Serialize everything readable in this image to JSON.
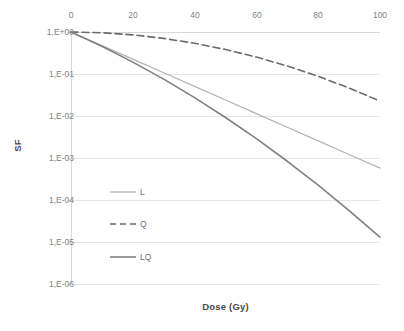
{
  "chart_data": {
    "type": "line",
    "title": "",
    "xlabel": "Dose (Gy)",
    "ylabel": "SF",
    "xlim": [
      0,
      100
    ],
    "ylim": [
      1e-06,
      1
    ],
    "yscale": "log",
    "xaxis_position": "top",
    "grid": "horizontal",
    "legend_position": "inside-left",
    "x_ticks": [
      "0",
      "20",
      "40",
      "60",
      "80",
      "100"
    ],
    "x_tick_values": [
      0,
      20,
      40,
      60,
      80,
      100
    ],
    "y_ticks": [
      "1,E+00",
      "1,E-01",
      "1,E-02",
      "1,E-03",
      "1,E-04",
      "1,E-05",
      "1,E-06"
    ],
    "y_tick_values": [
      1,
      0.1,
      0.01,
      0.001,
      0.0001,
      1e-05,
      1e-06
    ],
    "x": [
      0,
      10,
      20,
      30,
      40,
      50,
      60,
      70,
      80,
      90,
      100
    ],
    "series": [
      {
        "name": "L",
        "style": "solid",
        "color": "#b3b3b3",
        "values": [
          1.0,
          0.474,
          0.225,
          0.107,
          0.0506,
          0.024,
          0.0114,
          0.0054,
          0.00256,
          0.00121,
          0.000575
        ]
      },
      {
        "name": "Q",
        "style": "dashed",
        "color": "#6b6b6b",
        "values": [
          1.0,
          0.961,
          0.855,
          0.704,
          0.539,
          0.383,
          0.253,
          0.155,
          0.088,
          0.0463,
          0.0226
        ]
      },
      {
        "name": "LQ",
        "style": "solid",
        "color": "#808080",
        "values": [
          1.0,
          0.456,
          0.192,
          0.0754,
          0.0273,
          0.0092,
          0.00288,
          0.000836,
          0.000225,
          5.61e-05,
          1.3e-05
        ]
      }
    ]
  },
  "legend": {
    "entries": [
      {
        "label": "L"
      },
      {
        "label": "Q"
      },
      {
        "label": "LQ"
      }
    ]
  },
  "axes": {
    "x_title": "Dose (Gy)",
    "y_title": "SF"
  },
  "colors": {
    "grid": "#e6e6e6",
    "axis": "#d9d9d9",
    "tick_text": "#808285",
    "title_text": "#4a4a4a",
    "series_light": "#b3b3b3",
    "series_dark": "#6b6b6b",
    "series_mid": "#808080",
    "background": "#ffffff"
  }
}
